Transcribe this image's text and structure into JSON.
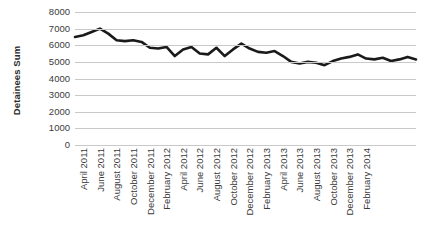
{
  "chart_data": {
    "type": "line",
    "title": "",
    "xlabel": "",
    "ylabel": "Detainees Sum",
    "ylim": [
      0,
      8000
    ],
    "ytick_values": [
      0,
      1000,
      2000,
      3000,
      4000,
      5000,
      6000,
      7000,
      8000
    ],
    "ytick_labels": [
      "0",
      "1000",
      "2000",
      "3000",
      "4000",
      "5000",
      "6000",
      "7000",
      "8000"
    ],
    "grid": true,
    "legend": "none",
    "line_color": "#1a1a1a",
    "line_width": 2.6,
    "x": [
      "April 2011",
      "May 2011",
      "June 2011",
      "July 2011",
      "August 2011",
      "September 2011",
      "October 2011",
      "November 2011",
      "December 2011",
      "January 2012",
      "February 2012",
      "March 2012",
      "April 2012",
      "May 2012",
      "June 2012",
      "July 2012",
      "August 2012",
      "September 2012",
      "October 2012",
      "November 2012",
      "December 2012",
      "January 2013",
      "February 2013",
      "March 2013",
      "April 2013",
      "May 2013",
      "June 2013",
      "July 2013",
      "August 2013",
      "September 2013",
      "October 2013",
      "November 2013",
      "December 2013",
      "January 2014",
      "February 2014",
      "March 2014"
    ],
    "values": [
      6500,
      6600,
      6800,
      7000,
      6700,
      6300,
      6250,
      6300,
      6200,
      5850,
      5800,
      5900,
      5350,
      5750,
      5900,
      5500,
      5450,
      5850,
      5350,
      5750,
      6100,
      5800,
      5600,
      5550,
      5650,
      5350,
      5000,
      4900,
      5000,
      4950,
      4800,
      5050,
      5200,
      5300,
      5450,
      5200
    ],
    "xtick_labels": [
      "April 2011",
      "June 2011",
      "August 2011",
      "October 2011",
      "December 2011",
      "February 2012",
      "April 2012",
      "June 2012",
      "August 2012",
      "October 2012",
      "December 2012",
      "February 2013",
      "April 2013",
      "June 2013",
      "August 2013",
      "October 2013",
      "December 2013",
      "February 2014"
    ],
    "xtick_indices": [
      0,
      2,
      4,
      6,
      8,
      10,
      12,
      14,
      16,
      18,
      20,
      22,
      24,
      26,
      28,
      30,
      32,
      34
    ],
    "series_points_after_feb2014": [
      5450,
      5200,
      5150,
      5250,
      5050,
      5150,
      5200,
      5150
    ],
    "full_values": [
      6500,
      6600,
      6800,
      7000,
      6700,
      6300,
      6250,
      6300,
      6200,
      5850,
      5800,
      5900,
      5350,
      5750,
      5900,
      5500,
      5450,
      5850,
      5350,
      5750,
      6100,
      5800,
      5600,
      5550,
      5650,
      5350,
      5000,
      4900,
      5000,
      4950,
      4800,
      5050,
      5200,
      5300,
      5450,
      5200,
      5150,
      5250,
      5050,
      5150,
      5300,
      5150
    ]
  }
}
